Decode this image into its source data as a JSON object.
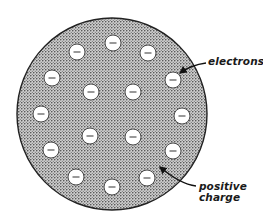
{
  "diagram": {
    "sphere": {
      "cx": 112,
      "cy": 114,
      "rx": 95,
      "ry": 96,
      "fill": "#b9b9b9",
      "stroke": "#222222",
      "meaning": "positive charge"
    },
    "electron_style": {
      "radius": 8,
      "fill": "#ffffff",
      "stroke": "#4a4a4a",
      "symbol": "minus-sign",
      "symbol_color": "#555555"
    },
    "electrons": [
      {
        "x": 113,
        "y": 43
      },
      {
        "x": 77,
        "y": 52
      },
      {
        "x": 148,
        "y": 53
      },
      {
        "x": 52,
        "y": 78
      },
      {
        "x": 173,
        "y": 80
      },
      {
        "x": 91,
        "y": 92
      },
      {
        "x": 133,
        "y": 92
      },
      {
        "x": 41,
        "y": 114
      },
      {
        "x": 182,
        "y": 116
      },
      {
        "x": 90,
        "y": 136
      },
      {
        "x": 133,
        "y": 137
      },
      {
        "x": 51,
        "y": 150
      },
      {
        "x": 173,
        "y": 151
      },
      {
        "x": 76,
        "y": 177
      },
      {
        "x": 147,
        "y": 178
      },
      {
        "x": 112,
        "y": 187
      }
    ],
    "labels": {
      "electrons": "electrons",
      "positive_line1": "positive",
      "positive_line2": "charge"
    },
    "arrows": {
      "electrons": {
        "from": [
          206,
          63
        ],
        "to": [
          180,
          73
        ]
      },
      "positive_charge": {
        "from": [
          196,
          186
        ],
        "to": [
          160,
          167
        ]
      }
    }
  }
}
